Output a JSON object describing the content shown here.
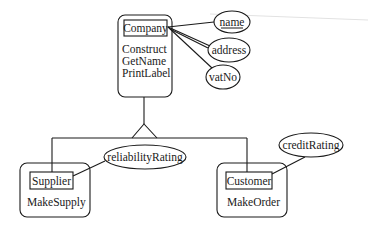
{
  "diagram": {
    "type": "er-class-hierarchy",
    "superclass": {
      "name": "Company",
      "methods": [
        "Construct",
        "GetName",
        "PrintLabel"
      ],
      "attributes": [
        {
          "label": "name",
          "key": true
        },
        {
          "label": "address",
          "key": false
        },
        {
          "label": "vatNo",
          "key": false
        }
      ]
    },
    "subclasses": [
      {
        "name": "Supplier",
        "methods": [
          "MakeSupply"
        ],
        "attributes": [
          {
            "label": "reliabilityRating",
            "key": false
          }
        ]
      },
      {
        "name": "Customer",
        "methods": [
          "MakeOrder"
        ],
        "attributes": [
          {
            "label": "creditRating",
            "key": false
          }
        ]
      }
    ],
    "relationship": "is-a (specialization)",
    "colors": {
      "ink": "#1a1a1a",
      "background": "#ffffff"
    }
  }
}
